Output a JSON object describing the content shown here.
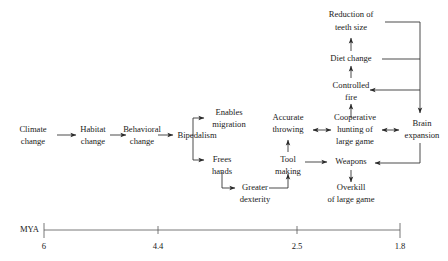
{
  "figure": {
    "type": "flow-diagram",
    "title": "",
    "background_color": "#ffffff",
    "text_color": "#1a1a1a",
    "line_color": "#2b2b2b"
  },
  "nodes": {
    "climate_change": {
      "line1": "Climate",
      "line2": "change"
    },
    "habitat_change": {
      "line1": "Habitat",
      "line2": "change"
    },
    "behavioral_change": {
      "line1": "Behavioral",
      "line2": "change"
    },
    "bipedalism": {
      "line1": "Bipedalism",
      "line2": ""
    },
    "enables_migration": {
      "line1": "Enables",
      "line2": "migration"
    },
    "frees_hands": {
      "line1": "Frees",
      "line2": "hands"
    },
    "greater_dexterity": {
      "line1": "Greater",
      "line2": "dexterity"
    },
    "tool_making": {
      "line1": "Tool",
      "line2": "making"
    },
    "accurate_throwing": {
      "line1": "Accurate",
      "line2": "throwing"
    },
    "weapons": {
      "line1": "Weapons",
      "line2": ""
    },
    "overkill_large_game": {
      "line1": "Overkill",
      "line2": "of large game"
    },
    "cooperative_hunting": {
      "line1": "Cooperative",
      "line2": "hunting of",
      "line3": "large game"
    },
    "controlled_fire": {
      "line1": "Controlled",
      "line2": "fire"
    },
    "diet_change": {
      "line1": "Diet change",
      "line2": ""
    },
    "reduction_teeth_size": {
      "line1": "Reduction of",
      "line2": "teeth size"
    },
    "brain_expansion": {
      "line1": "Brain",
      "line2": "expansion"
    }
  },
  "timeline": {
    "axis_title": "MYA",
    "ticks": [
      {
        "label": "6",
        "x": 44
      },
      {
        "label": "4.4",
        "x": 158
      },
      {
        "label": "2.5",
        "x": 297
      },
      {
        "label": "1.8",
        "x": 400
      }
    ]
  },
  "edges": [
    {
      "from": "climate_change",
      "to": "habitat_change",
      "style": "arrow"
    },
    {
      "from": "habitat_change",
      "to": "behavioral_change",
      "style": "arrow"
    },
    {
      "from": "behavioral_change",
      "to": "bipedalism",
      "style": "arrow"
    },
    {
      "from": "bipedalism",
      "to": "enables_migration",
      "style": "elbow-arrow"
    },
    {
      "from": "bipedalism",
      "to": "frees_hands",
      "style": "elbow-arrow"
    },
    {
      "from": "frees_hands",
      "to": "greater_dexterity",
      "style": "elbow-arrow"
    },
    {
      "from": "greater_dexterity",
      "to": "tool_making",
      "style": "elbow-arrow"
    },
    {
      "from": "tool_making",
      "to": "accurate_throwing",
      "style": "arrow"
    },
    {
      "from": "tool_making",
      "to": "weapons",
      "style": "arrow"
    },
    {
      "from": "accurate_throwing",
      "to": "cooperative_hunting",
      "style": "double-arrow"
    },
    {
      "from": "weapons",
      "to": "overkill_large_game",
      "style": "arrow"
    },
    {
      "from": "cooperative_hunting",
      "to": "controlled_fire",
      "style": "arrow"
    },
    {
      "from": "controlled_fire",
      "to": "diet_change",
      "style": "arrow"
    },
    {
      "from": "diet_change",
      "to": "reduction_teeth_size",
      "style": "arrow"
    },
    {
      "from": "cooperative_hunting",
      "to": "brain_expansion",
      "style": "double-arrow"
    },
    {
      "from": "reduction_teeth_size",
      "to": "brain_expansion",
      "style": "elbow-arrow"
    },
    {
      "from": "diet_change",
      "to": "brain_expansion",
      "style": "elbow-arrow"
    },
    {
      "from": "brain_expansion",
      "to": "controlled_fire",
      "style": "elbow-arrow"
    },
    {
      "from": "brain_expansion",
      "to": "weapons",
      "style": "elbow-arrow"
    }
  ]
}
